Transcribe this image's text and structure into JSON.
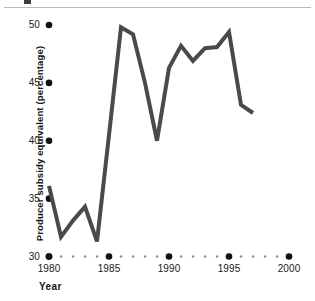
{
  "figure": {
    "top_rule_visible": true,
    "background_color": "#ffffff"
  },
  "chart_data": {
    "type": "line",
    "title": "",
    "xlabel": "Year",
    "ylabel": "Producer subsidy equivalent (percentage)",
    "xlim": [
      1980,
      2000
    ],
    "ylim": [
      30,
      50
    ],
    "xticks": [
      1980,
      1985,
      1990,
      1995,
      2000
    ],
    "xtick_labels": [
      "1980",
      "1985",
      "1990",
      "1995",
      "2000"
    ],
    "yticks": [
      30,
      35,
      40,
      45,
      50
    ],
    "ytick_labels": [
      "30",
      "35",
      "40",
      "45",
      "50"
    ],
    "grid": false,
    "legend": "none",
    "tick_marker_style": "dot",
    "minor_xticks_every": 1,
    "line_color": "#4a4a4a",
    "line_width": 4,
    "marker_color": "#111111",
    "x": [
      1980,
      1981,
      1982,
      1983,
      1984,
      1985,
      1986,
      1987,
      1988,
      1989,
      1990,
      1991,
      1992,
      1993,
      1994,
      1995,
      1996,
      1997
    ],
    "values": [
      36.1,
      31.7,
      33.1,
      34.3,
      31.3,
      40.5,
      49.8,
      49.2,
      45.0,
      40.0,
      46.3,
      48.2,
      46.9,
      48.0,
      48.1,
      49.4,
      43.1,
      42.4
    ],
    "series": [
      {
        "name": "Producer subsidy equivalent",
        "values": [
          36.1,
          31.7,
          33.1,
          34.3,
          31.3,
          40.5,
          49.8,
          49.2,
          45.0,
          40.0,
          46.3,
          48.2,
          46.9,
          48.0,
          48.1,
          49.4,
          43.1,
          42.4
        ]
      }
    ]
  }
}
